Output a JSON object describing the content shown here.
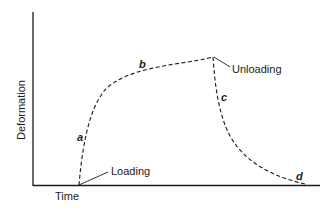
{
  "diagram": {
    "type": "creep-recovery-curve",
    "axes": {
      "y_label": "Deformation",
      "x_label": "Time"
    },
    "annotations": {
      "loading": "Loading",
      "unloading": "Unloading"
    },
    "curve_labels": {
      "a": "a",
      "b": "b",
      "c": "c",
      "d": "d"
    },
    "colors": {
      "line": "#1a1a1a",
      "background": "#ffffff"
    }
  }
}
